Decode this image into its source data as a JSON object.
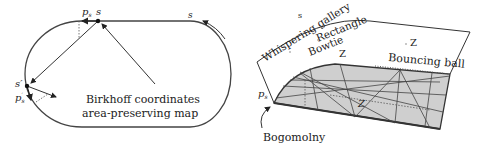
{
  "left_panel": {
    "labels": {
      "p_s": "p",
      "p_s_sub": "s",
      "s_top": "s",
      "s_arrow": "s",
      "s_prime": "s′",
      "p_s_prime": "p",
      "p_s_prime_sub": "s",
      "p_s_prime_sup": "′",
      "caption_line1": "Birkhoff coordinates",
      "caption_line2": "area-preserving map"
    }
  },
  "right_panel": {
    "labels": {
      "s_axis": "s",
      "p_axis": "p",
      "p_axis_sub": "s",
      "whispering_gallery": "Whispering gallery",
      "rectangle": "Rectangle",
      "bowtie": "Bowtie",
      "z_upper_left": "Z",
      "z_upper_right": "Z",
      "bouncing_ball": "Bouncing ball",
      "z_surface": "Z",
      "bogomolny": "Bogomolny"
    },
    "colors": {
      "surface_fill": "#cfcfcf",
      "line": "#333333"
    }
  }
}
